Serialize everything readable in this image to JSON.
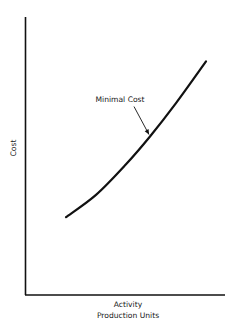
{
  "chart_data": {
    "type": "line",
    "title": "",
    "xlabel": "Activity\nProduction Units",
    "xlabel_lines": [
      "Activity",
      "Production Units"
    ],
    "ylabel": "Cost",
    "x_ticks": [],
    "y_ticks": [],
    "xlim": [
      0,
      100
    ],
    "ylim": [
      0,
      100
    ],
    "grid": false,
    "series": [
      {
        "name": "Cost curve",
        "x": [
          20,
          35,
          50,
          62,
          75,
          90
        ],
        "y": [
          28,
          36,
          47,
          57,
          69,
          84
        ]
      }
    ],
    "annotations": [
      {
        "text": "Minimal Cost",
        "x": 62,
        "y": 57
      }
    ],
    "colors": {
      "ink": "#111111",
      "background": "#ffffff"
    }
  }
}
